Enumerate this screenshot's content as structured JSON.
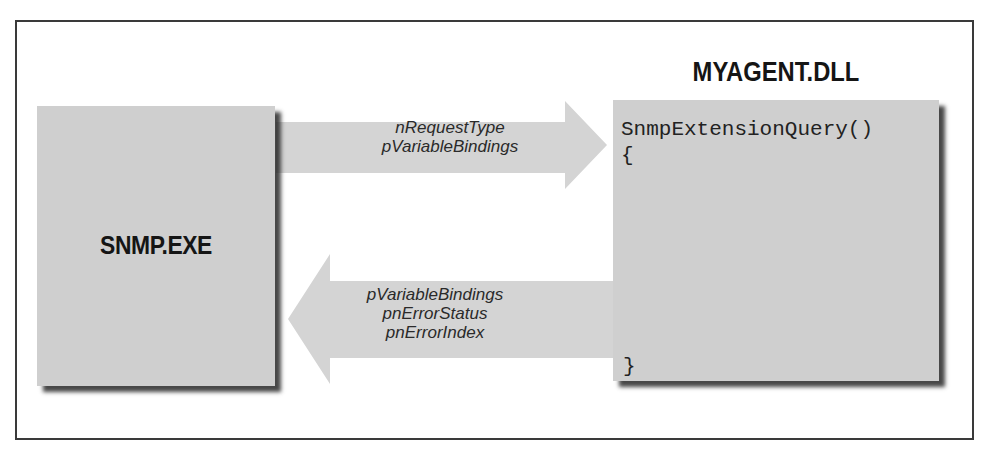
{
  "diagram": {
    "type": "flow",
    "frame": true,
    "left_box": {
      "label": "SNMP.EXE"
    },
    "right_box": {
      "title": "MYAGENT.DLL",
      "code": {
        "line1": "SnmpExtensionQuery()",
        "line2": "{",
        "close": "}"
      }
    },
    "request_arrow": {
      "direction": "right",
      "from": "SNMP.EXE",
      "to": "MYAGENT.DLL",
      "labels": [
        "nRequestType",
        "pVariableBindings"
      ]
    },
    "response_arrow": {
      "direction": "left",
      "from": "MYAGENT.DLL",
      "to": "SNMP.EXE",
      "labels": [
        "pVariableBindings",
        "pnErrorStatus",
        "pnErrorIndex"
      ]
    },
    "colors": {
      "box_fill": "#cfcfcf",
      "arrow_fill": "#d4d4d4",
      "shadow": "#3a3a3a",
      "frame": "#3a3a3a",
      "text": "#151515"
    }
  }
}
